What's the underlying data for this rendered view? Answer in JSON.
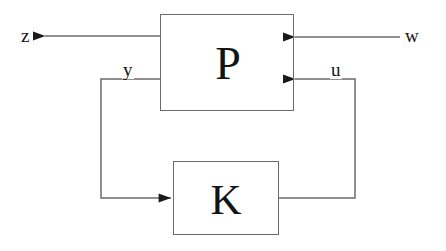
{
  "diagram": {
    "type": "block-diagram",
    "canvas": {
      "width": 446,
      "height": 251
    },
    "colors": {
      "background": "#ffffff",
      "line": "#6b6b6b",
      "arrowhead": "#1a1a1a",
      "text": "#131313"
    },
    "blocks": [
      {
        "id": "P",
        "label": "P",
        "name": "plant-block",
        "x": 160,
        "y": 14,
        "width": 134,
        "height": 97
      },
      {
        "id": "K",
        "label": "K",
        "name": "controller-block",
        "x": 173,
        "y": 161,
        "width": 106,
        "height": 74
      }
    ],
    "signals": [
      {
        "id": "z",
        "label": "z",
        "role": "exogenous-output",
        "direction": "out-left",
        "from_block": "P",
        "label_x": 20,
        "label_y": 26
      },
      {
        "id": "w",
        "label": "w",
        "role": "exogenous-input",
        "direction": "in-right",
        "to_block": "P",
        "label_x": 404,
        "label_y": 26
      },
      {
        "id": "y",
        "label": "y",
        "role": "measured-output",
        "direction": "P-to-K",
        "from_block": "P",
        "to_block": "K",
        "label_x": 122,
        "label_y": 60
      },
      {
        "id": "u",
        "label": "u",
        "role": "control-input",
        "direction": "K-to-P",
        "from_block": "K",
        "to_block": "P",
        "label_x": 330,
        "label_y": 60
      }
    ]
  }
}
